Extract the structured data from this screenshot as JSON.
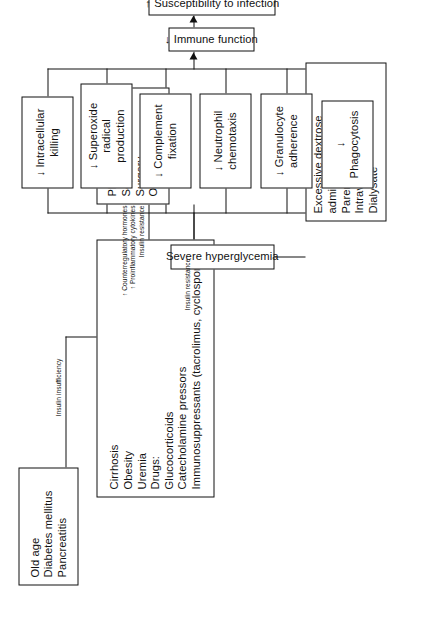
{
  "diagram": {
    "orientation": "rotated-90-counterclockwise",
    "nodes": {
      "risk_conditions": {
        "id": "risk-conditions",
        "text": "Old age\nDiabetes mellitus\nPancreatitis"
      },
      "insulin_resistance_causes": {
        "id": "insulin-resistance-causes",
        "text": "Cirrhosis\nObesity\nUremia\nDrugs:\n   Glucocorticoids\n   Catecholamine pressors\n   Immunosuppressants (tacrolimus, cyclosporine)"
      },
      "physiologic_stress": {
        "id": "physiologic-stress",
        "text": "Physiologic stress:\nSepsis\nSurgery\nOrgan failure"
      },
      "dextrose_admin": {
        "id": "excessive-dextrose-administration",
        "text": "Excessive dextrose\nadministration:\n   Parenteral nutrition\n   Intravenous fluids\n   Dialysate"
      },
      "severe_hyperglycemia": {
        "id": "severe-hyperglycemia",
        "text": "Severe hyperglycemia"
      },
      "effect_phagocytosis": {
        "id": "decreased-phagocytosis",
        "text": "↓ Phagocytosis"
      },
      "effect_granulocyte": {
        "id": "decreased-granulocyte-adherence",
        "text": "↓ Granulocyte\nadherence"
      },
      "effect_neutrophil": {
        "id": "decreased-neutrophil-chemotaxis",
        "text": "↓ Neutrophil\nchemotaxis"
      },
      "effect_complement": {
        "id": "decreased-complement-fixation",
        "text": "↓ Complement\nfixation"
      },
      "effect_superoxide": {
        "id": "decreased-superoxide-radical-production",
        "text": "↓ Superoxide\nradical production"
      },
      "effect_intracellular": {
        "id": "decreased-intracellular-killing",
        "text": "↓ Intracellular\nkilling"
      },
      "immune_function": {
        "id": "decreased-immune-function",
        "text": "↓ Immune function"
      },
      "susceptibility": {
        "id": "increased-susceptibility-to-infection",
        "text": "↑ Susceptibility to infection"
      }
    },
    "edge_labels": {
      "insulin_insufficiency": "Insulin insufficiency",
      "insulin_resistance_drugs": "Insulin resistance",
      "stress_mediators": "↑ Counterregulatory hormones\n↑ Proinflammatory cytokines\nInsulin resistance"
    },
    "colors": {
      "stroke": "#111111",
      "background": "#ffffff",
      "text": "#111111"
    }
  }
}
